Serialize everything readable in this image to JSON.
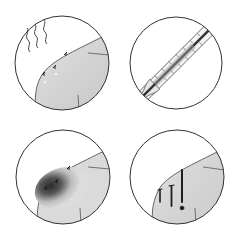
{
  "illustration": {
    "layout": "2x2 grid of circular icons",
    "colors": {
      "background": "#ffffff",
      "outline": "#333333",
      "skin": "#cfcfcf",
      "skin_light": "#e4e4e4",
      "bruise_dark": "#2a2a2a",
      "blood": "#1e1e1e"
    },
    "panels": [
      {
        "id": "heat-skin",
        "label": "Skin with heat waves and bite marks"
      },
      {
        "id": "thermometer",
        "label": "Thermometer"
      },
      {
        "id": "bruise",
        "label": "Skin with dark bruise and bite marks"
      },
      {
        "id": "bleeding",
        "label": "Skin with bleeding drips"
      }
    ]
  }
}
